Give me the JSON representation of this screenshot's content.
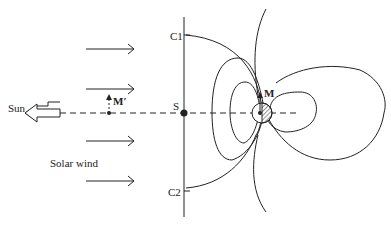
{
  "diagram": {
    "labels": {
      "c1": "C1",
      "c2": "C2",
      "s": "S",
      "sun": "Sun",
      "m_prime": "M′",
      "m": "M",
      "solar_wind": "Solar wind"
    },
    "elements": {
      "solar_wind_arrows": 4,
      "sun_direction_arrow": "hollow-left-arrow",
      "sun_earth_line": "dashed",
      "magnetopause_boundary": "vertical line C1–C2 through S",
      "planet": "circle with hatched night side",
      "dipole_vectors": [
        "M′",
        "M"
      ]
    },
    "colors": {
      "ink": "#222222",
      "background": "#ffffff"
    }
  }
}
